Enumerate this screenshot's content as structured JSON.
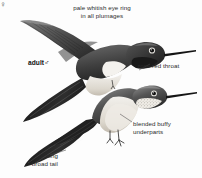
{
  "plate": {
    "subject": "hummingbird-field-guide-plate",
    "background_color": "#fdfdfd",
    "ink_color": "#2b2b2b"
  },
  "captions": {
    "top": "pale whitish eye ring\nin all plumages",
    "rose_throat": "rose red throat",
    "blended_buffy": "blended buffy\nunderparts",
    "long_broad_tail": "long\nbroad tail"
  },
  "figures": {
    "upper": {
      "label": "adult",
      "sex_symbol": "♂",
      "pose": "flying",
      "name": "adult-male-hummingbird"
    },
    "lower": {
      "sex_symbol": "♀",
      "pose": "perched",
      "name": "female-hummingbird"
    }
  }
}
